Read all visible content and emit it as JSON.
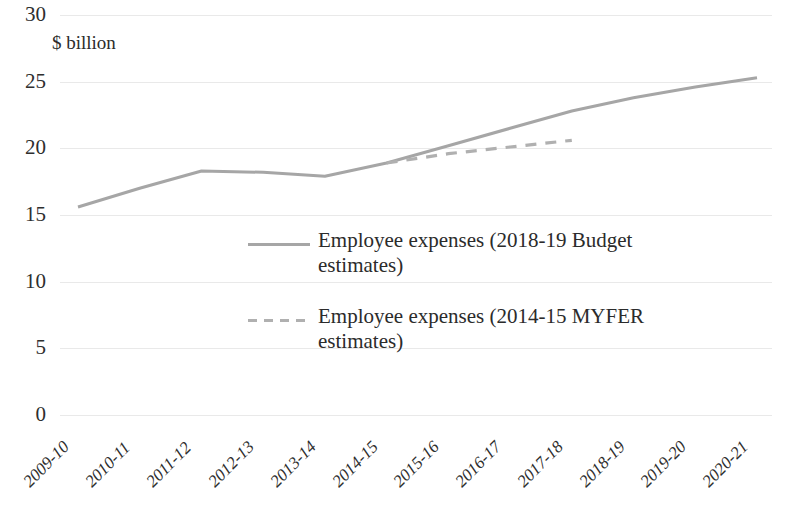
{
  "chart_data": {
    "type": "line",
    "title": "",
    "xlabel": "",
    "ylabel": "$ billion",
    "ylim": [
      0,
      30
    ],
    "ytick_step": 5,
    "yticks": [
      "30",
      "25",
      "20",
      "15",
      "10",
      "5",
      "0"
    ],
    "grid": true,
    "legend_position": "inside-center",
    "line_color": "#a6a6a6",
    "categories": [
      "2009-10",
      "2010-11",
      "2011-12",
      "2012-13",
      "2013-14",
      "2014-15",
      "2015-16",
      "2016-17",
      "2017-18",
      "2018-19",
      "2019-20",
      "2020-21"
    ],
    "series": [
      {
        "name": "Employee expenses (2018-19 Budget estimates)",
        "style": "solid",
        "color": "#a6a6a6",
        "values": [
          15.6,
          17.0,
          18.3,
          18.2,
          17.9,
          18.9,
          20.2,
          21.5,
          22.8,
          23.8,
          24.6,
          25.3
        ]
      },
      {
        "name": "Employee expenses (2014-15 MYFER estimates)",
        "style": "dashed",
        "color": "#b0b0b0",
        "values": [
          null,
          null,
          null,
          null,
          null,
          18.9,
          19.6,
          20.1,
          20.6,
          null,
          null,
          null
        ]
      }
    ]
  },
  "legend": {
    "items": [
      {
        "label": "Employee expenses (2018-19 Budget estimates)",
        "style": "solid",
        "color": "#a6a6a6"
      },
      {
        "label": "Employee expenses (2014-15 MYFER estimates)",
        "style": "dashed",
        "color": "#b0b0b0"
      }
    ]
  }
}
